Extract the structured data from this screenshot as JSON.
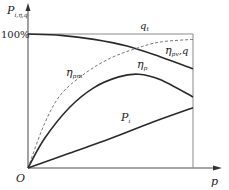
{
  "chart_data": {
    "type": "line",
    "title": "",
    "xlabel": "p",
    "ylabel": "P_i, η, q",
    "origin_label": "O",
    "y_tick_labels": [
      "100%"
    ],
    "ylim": [
      0,
      100
    ],
    "xlim": [
      0,
      1
    ],
    "grid": false,
    "legend": "inline curve labels",
    "series": [
      {
        "name": "q_t",
        "label": "q_t",
        "style": "thin-line",
        "x": [
          0,
          1
        ],
        "values": [
          100,
          100
        ]
      },
      {
        "name": "η_pv, q",
        "label": "η pv,q",
        "style": "solid",
        "x": [
          0,
          0.2,
          0.4,
          0.6,
          0.8,
          1.0
        ],
        "values": [
          100,
          99,
          96,
          91,
          83,
          74
        ]
      },
      {
        "name": "η_pm",
        "label": "η pm",
        "style": "dashed",
        "x": [
          0,
          0.1,
          0.2,
          0.35,
          0.5,
          0.65,
          0.8,
          1.0
        ],
        "values": [
          0,
          33,
          55,
          71,
          82,
          89,
          94,
          96
        ]
      },
      {
        "name": "η_p",
        "label": "η p",
        "style": "solid",
        "x": [
          0,
          0.1,
          0.25,
          0.4,
          0.55,
          0.67,
          0.8,
          1.0
        ],
        "values": [
          0,
          22,
          45,
          60,
          68,
          70,
          66,
          53
        ]
      },
      {
        "name": "P_i",
        "label": "P i",
        "style": "solid",
        "x": [
          0,
          0.25,
          0.5,
          0.75,
          1.0
        ],
        "values": [
          0,
          11,
          22,
          34,
          45
        ]
      }
    ]
  },
  "labels": {
    "y_axis_main": "P",
    "y_axis_sub": "i,η,q",
    "y_tick_100": "100%",
    "origin": "O",
    "x_axis": "p",
    "qt_main": "q",
    "qt_sub": "t",
    "etapvq_main": "η",
    "etapvq_sub": "pv",
    "etapvq_tail": ",q",
    "etapm_main": "η",
    "etapm_sub": "pm",
    "etap_main": "η",
    "etap_sub": "p",
    "pi_main": "P",
    "pi_sub": "i"
  },
  "colors": {
    "curve": "#2a2a2a",
    "axis": "#555555",
    "frame": "#888888",
    "dashed": "#777777"
  }
}
